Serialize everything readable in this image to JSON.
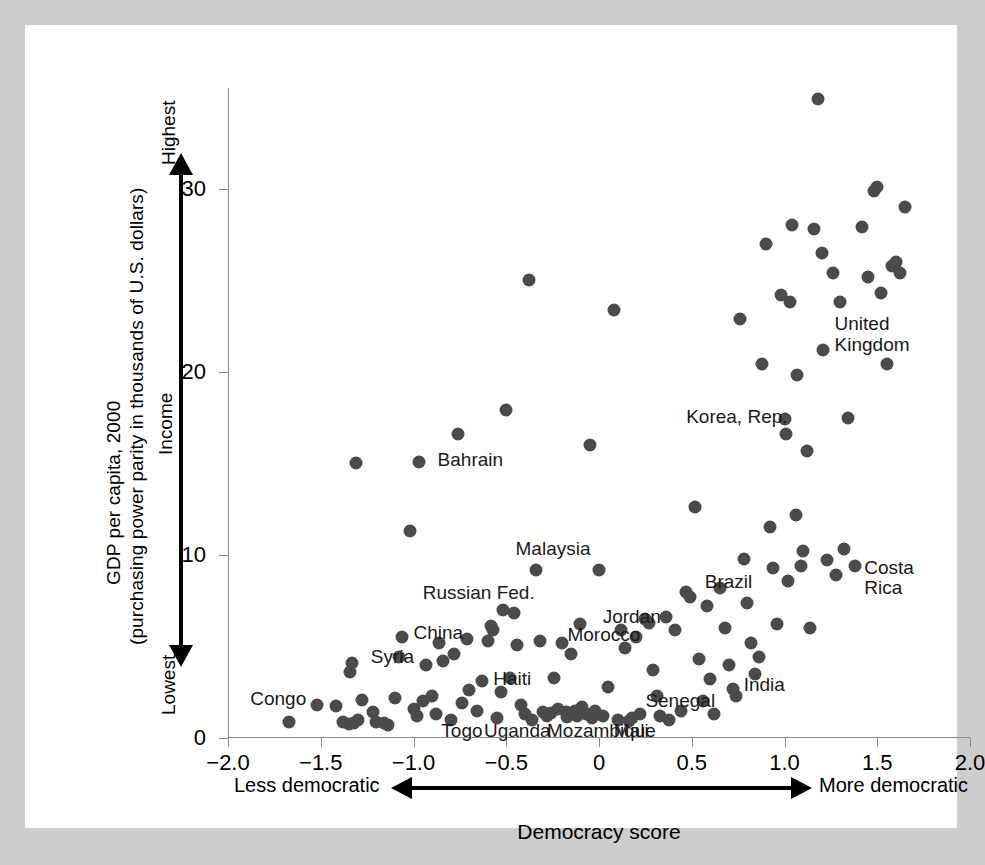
{
  "chart_data": {
    "type": "scatter",
    "title": "",
    "xlabel": "Democracy score",
    "ylabel": "GDP per capita, 2000",
    "ylabel_line2": "(purchasing power parity in thousands of U.S. dollars)",
    "xlim": [
      -2.0,
      2.0
    ],
    "ylim": [
      0,
      35.5
    ],
    "grid": false,
    "legend": null,
    "xticks": [
      "−2.0",
      "−1.5",
      "−1.0",
      "−0.5",
      "0",
      "0.5",
      "1.0",
      "1.5",
      "2.0"
    ],
    "xtick_values": [
      -2.0,
      -1.5,
      -1.0,
      -0.5,
      0,
      0.5,
      1.0,
      1.5,
      2.0
    ],
    "yticks": [
      "0",
      "10",
      "20",
      "30"
    ],
    "ytick_values": [
      0,
      10,
      20,
      30
    ],
    "y_axis_arrow": {
      "word": "Income",
      "top_label": "Highest",
      "bottom_label": "Lowest"
    },
    "x_axis_arrow": {
      "left_label": "Less democratic",
      "right_label": "More democratic"
    },
    "marker_color": "#4b4b4b",
    "marker_size_px": 13,
    "points": [
      {
        "x": -1.67,
        "y": 0.9
      },
      {
        "x": -1.52,
        "y": 1.8
      },
      {
        "x": -1.42,
        "y": 1.75
      },
      {
        "x": -1.38,
        "y": 0.9
      },
      {
        "x": -1.35,
        "y": 0.75
      },
      {
        "x": -1.32,
        "y": 0.8
      },
      {
        "x": -1.3,
        "y": 1.0
      },
      {
        "x": -1.33,
        "y": 4.1
      },
      {
        "x": -1.34,
        "y": 3.6
      },
      {
        "x": -1.31,
        "y": 15.0
      },
      {
        "x": -1.28,
        "y": 2.1
      },
      {
        "x": -1.22,
        "y": 1.4
      },
      {
        "x": -1.2,
        "y": 0.85
      },
      {
        "x": -1.16,
        "y": 0.8
      },
      {
        "x": -1.14,
        "y": 0.7
      },
      {
        "x": -1.1,
        "y": 2.2
      },
      {
        "x": -1.08,
        "y": 4.4
      },
      {
        "x": -1.06,
        "y": 5.5
      },
      {
        "x": -1.02,
        "y": 11.3
      },
      {
        "x": -1.0,
        "y": 1.6
      },
      {
        "x": -0.98,
        "y": 1.2
      },
      {
        "x": -0.97,
        "y": 15.1
      },
      {
        "x": -0.95,
        "y": 2.0
      },
      {
        "x": -0.93,
        "y": 4.0
      },
      {
        "x": -0.9,
        "y": 2.3
      },
      {
        "x": -0.88,
        "y": 1.3
      },
      {
        "x": -0.86,
        "y": 5.2
      },
      {
        "x": -0.84,
        "y": 4.2
      },
      {
        "x": -0.8,
        "y": 1.0
      },
      {
        "x": -0.78,
        "y": 4.6
      },
      {
        "x": -0.76,
        "y": 16.6
      },
      {
        "x": -0.74,
        "y": 1.9
      },
      {
        "x": -0.71,
        "y": 5.4
      },
      {
        "x": -0.7,
        "y": 2.6
      },
      {
        "x": -0.66,
        "y": 1.5
      },
      {
        "x": -0.63,
        "y": 3.1
      },
      {
        "x": -0.6,
        "y": 5.3
      },
      {
        "x": -0.58,
        "y": 6.1
      },
      {
        "x": -0.57,
        "y": 5.9
      },
      {
        "x": -0.55,
        "y": 1.1
      },
      {
        "x": -0.53,
        "y": 2.5
      },
      {
        "x": -0.52,
        "y": 7.0
      },
      {
        "x": -0.5,
        "y": 17.9
      },
      {
        "x": -0.48,
        "y": 3.3
      },
      {
        "x": -0.46,
        "y": 6.8
      },
      {
        "x": -0.44,
        "y": 5.1
      },
      {
        "x": -0.42,
        "y": 1.8
      },
      {
        "x": -0.4,
        "y": 1.3
      },
      {
        "x": -0.38,
        "y": 25.0
      },
      {
        "x": -0.36,
        "y": 1.0
      },
      {
        "x": -0.34,
        "y": 9.2
      },
      {
        "x": -0.32,
        "y": 5.3
      },
      {
        "x": -0.3,
        "y": 1.4
      },
      {
        "x": -0.28,
        "y": 1.2
      },
      {
        "x": -0.26,
        "y": 1.35
      },
      {
        "x": -0.24,
        "y": 3.3
      },
      {
        "x": -0.22,
        "y": 1.6
      },
      {
        "x": -0.2,
        "y": 5.2
      },
      {
        "x": -0.18,
        "y": 1.4
      },
      {
        "x": -0.17,
        "y": 1.15
      },
      {
        "x": -0.15,
        "y": 4.6
      },
      {
        "x": -0.13,
        "y": 1.5
      },
      {
        "x": -0.12,
        "y": 1.2
      },
      {
        "x": -0.1,
        "y": 6.2
      },
      {
        "x": -0.09,
        "y": 1.7
      },
      {
        "x": -0.07,
        "y": 1.3
      },
      {
        "x": -0.05,
        "y": 16.0
      },
      {
        "x": -0.04,
        "y": 1.1
      },
      {
        "x": -0.02,
        "y": 1.45
      },
      {
        "x": 0.0,
        "y": 9.2
      },
      {
        "x": 0.02,
        "y": 1.2
      },
      {
        "x": 0.05,
        "y": 2.8
      },
      {
        "x": 0.08,
        "y": 23.4
      },
      {
        "x": 0.1,
        "y": 1.0
      },
      {
        "x": 0.12,
        "y": 5.9
      },
      {
        "x": 0.14,
        "y": 4.9
      },
      {
        "x": 0.16,
        "y": 0.95
      },
      {
        "x": 0.18,
        "y": 1.1
      },
      {
        "x": 0.2,
        "y": 5.5
      },
      {
        "x": 0.22,
        "y": 1.3
      },
      {
        "x": 0.25,
        "y": 6.5
      },
      {
        "x": 0.27,
        "y": 6.3
      },
      {
        "x": 0.29,
        "y": 3.7
      },
      {
        "x": 0.31,
        "y": 2.3
      },
      {
        "x": 0.33,
        "y": 1.2
      },
      {
        "x": 0.36,
        "y": 6.6
      },
      {
        "x": 0.38,
        "y": 1.0
      },
      {
        "x": 0.41,
        "y": 5.9
      },
      {
        "x": 0.44,
        "y": 1.5
      },
      {
        "x": 0.47,
        "y": 8.0
      },
      {
        "x": 0.49,
        "y": 7.7
      },
      {
        "x": 0.52,
        "y": 12.6
      },
      {
        "x": 0.54,
        "y": 4.3
      },
      {
        "x": 0.56,
        "y": 2.0
      },
      {
        "x": 0.58,
        "y": 7.2
      },
      {
        "x": 0.6,
        "y": 3.2
      },
      {
        "x": 0.62,
        "y": 1.3
      },
      {
        "x": 0.65,
        "y": 8.2
      },
      {
        "x": 0.68,
        "y": 6.0
      },
      {
        "x": 0.7,
        "y": 4.0
      },
      {
        "x": 0.72,
        "y": 2.7
      },
      {
        "x": 0.74,
        "y": 2.3
      },
      {
        "x": 0.76,
        "y": 22.9
      },
      {
        "x": 0.78,
        "y": 9.8
      },
      {
        "x": 0.8,
        "y": 7.4
      },
      {
        "x": 0.82,
        "y": 5.2
      },
      {
        "x": 0.84,
        "y": 3.5
      },
      {
        "x": 0.86,
        "y": 4.4
      },
      {
        "x": 0.88,
        "y": 20.4
      },
      {
        "x": 0.9,
        "y": 27.0
      },
      {
        "x": 0.92,
        "y": 11.5
      },
      {
        "x": 0.94,
        "y": 9.3
      },
      {
        "x": 0.96,
        "y": 6.2
      },
      {
        "x": 0.98,
        "y": 24.2
      },
      {
        "x": 1.0,
        "y": 17.4
      },
      {
        "x": 1.01,
        "y": 16.6
      },
      {
        "x": 1.02,
        "y": 8.6
      },
      {
        "x": 1.03,
        "y": 23.8
      },
      {
        "x": 1.04,
        "y": 28.0
      },
      {
        "x": 1.06,
        "y": 12.2
      },
      {
        "x": 1.07,
        "y": 19.8
      },
      {
        "x": 1.09,
        "y": 9.4
      },
      {
        "x": 1.1,
        "y": 10.2
      },
      {
        "x": 1.12,
        "y": 15.7
      },
      {
        "x": 1.14,
        "y": 6.0
      },
      {
        "x": 1.16,
        "y": 27.8
      },
      {
        "x": 1.18,
        "y": 34.9
      },
      {
        "x": 1.2,
        "y": 26.5
      },
      {
        "x": 1.21,
        "y": 21.2
      },
      {
        "x": 1.23,
        "y": 9.7
      },
      {
        "x": 1.26,
        "y": 25.4
      },
      {
        "x": 1.28,
        "y": 8.9
      },
      {
        "x": 1.3,
        "y": 23.8
      },
      {
        "x": 1.32,
        "y": 10.3
      },
      {
        "x": 1.34,
        "y": 17.5
      },
      {
        "x": 1.38,
        "y": 9.4
      },
      {
        "x": 1.42,
        "y": 27.9
      },
      {
        "x": 1.45,
        "y": 25.2
      },
      {
        "x": 1.48,
        "y": 29.9
      },
      {
        "x": 1.5,
        "y": 30.1
      },
      {
        "x": 1.52,
        "y": 24.3
      },
      {
        "x": 1.55,
        "y": 20.4
      },
      {
        "x": 1.58,
        "y": 25.8
      },
      {
        "x": 1.6,
        "y": 26.0
      },
      {
        "x": 1.62,
        "y": 25.4
      },
      {
        "x": 1.65,
        "y": 29.0
      }
    ],
    "annotations": [
      {
        "label": "Congo",
        "x": -1.88,
        "y": 2.0,
        "align": "left"
      },
      {
        "label": "Syria",
        "x": -1.23,
        "y": 4.3,
        "align": "left"
      },
      {
        "label": "China",
        "x": -1.0,
        "y": 5.6,
        "align": "left"
      },
      {
        "label": "Haiti",
        "x": -0.57,
        "y": 3.1,
        "align": "left"
      },
      {
        "label": "Togo",
        "x": -0.85,
        "y": 0.25,
        "align": "left"
      },
      {
        "label": "Uganda",
        "x": -0.62,
        "y": 0.25,
        "align": "left"
      },
      {
        "label": "Mozambique",
        "x": -0.28,
        "y": 0.25,
        "align": "left"
      },
      {
        "label": "Mali",
        "x": 0.08,
        "y": 0.25,
        "align": "left"
      },
      {
        "label": "Russian Fed.",
        "x": -0.95,
        "y": 7.8,
        "align": "left"
      },
      {
        "label": "Malaysia",
        "x": -0.45,
        "y": 10.2,
        "align": "left"
      },
      {
        "label": "Bahrain",
        "x": -0.87,
        "y": 15.1,
        "align": "left"
      },
      {
        "label": "Morocco",
        "x": -0.17,
        "y": 5.5,
        "align": "left"
      },
      {
        "label": "Jordan",
        "x": 0.02,
        "y": 6.5,
        "align": "left"
      },
      {
        "label": "Senegal",
        "x": 0.25,
        "y": 1.9,
        "align": "left"
      },
      {
        "label": "Brazil",
        "x": 0.57,
        "y": 8.4,
        "align": "left"
      },
      {
        "label": "India",
        "x": 0.78,
        "y": 2.8,
        "align": "left"
      },
      {
        "label": "Korea, Rep.",
        "x": 0.47,
        "y": 17.4,
        "align": "left"
      },
      {
        "label": "United\nKingdom",
        "x": 1.27,
        "y": 22.5,
        "align": "left"
      },
      {
        "label": "Costa\nRica",
        "x": 1.43,
        "y": 9.2,
        "align": "left"
      }
    ]
  }
}
